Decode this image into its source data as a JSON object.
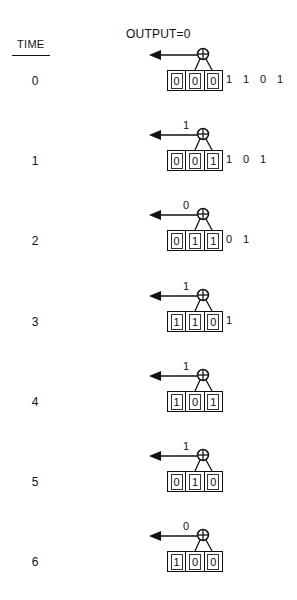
{
  "header": {
    "time_label": "TIME",
    "output_label": "OUTPUT=0"
  },
  "steps": [
    {
      "time": "0",
      "output": "",
      "register": [
        "0",
        "0",
        "0"
      ],
      "stream": [
        "1",
        "1",
        "0",
        "1"
      ]
    },
    {
      "time": "1",
      "output": "1",
      "register": [
        "0",
        "0",
        "1"
      ],
      "stream": [
        "1",
        "0",
        "1"
      ]
    },
    {
      "time": "2",
      "output": "0",
      "register": [
        "0",
        "1",
        "1"
      ],
      "stream": [
        "0",
        "1"
      ]
    },
    {
      "time": "3",
      "output": "1",
      "register": [
        "1",
        "1",
        "0"
      ],
      "stream": [
        "1"
      ]
    },
    {
      "time": "4",
      "output": "1",
      "register": [
        "1",
        "0",
        "1"
      ],
      "stream": []
    },
    {
      "time": "5",
      "output": "1",
      "register": [
        "0",
        "1",
        "0"
      ],
      "stream": []
    },
    {
      "time": "6",
      "output": "0",
      "register": [
        "1",
        "0",
        "0"
      ],
      "stream": []
    }
  ],
  "icons": {
    "xor": "circled-plus",
    "output_arrow": "left-arrow"
  },
  "colors": {
    "ink": "#111111",
    "background": "#ffffff"
  }
}
